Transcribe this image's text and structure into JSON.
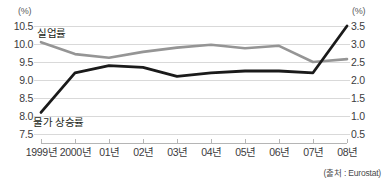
{
  "axes": {
    "left_unit": "(%)",
    "right_unit": "(%)",
    "left_ticks": [
      "10.5",
      "10.0",
      "9.5",
      "9.0",
      "8.5",
      "8.0",
      "7.5"
    ],
    "right_ticks": [
      "3.5",
      "3.0",
      "2.5",
      "2.0",
      "1.5",
      "1.0",
      "0.5"
    ],
    "x_ticks": [
      "1999년",
      "2000년",
      "01년",
      "02년",
      "03년",
      "04년",
      "05년",
      "06년",
      "07년",
      "08년"
    ]
  },
  "labels": {
    "unemployment": "실업률",
    "inflation": "물가 상승률"
  },
  "source": "(출처 : Eurostat)",
  "colors": {
    "unemployment_line": "#959595",
    "inflation_line": "#1a1a1a",
    "gridline": "#d9d9d9",
    "text": "#231f20"
  },
  "chart_data": {
    "type": "line",
    "title": "",
    "xlabel": "",
    "ylabel": "",
    "grid": true,
    "legend": "inline-labels",
    "categories": [
      "1999년",
      "2000년",
      "01년",
      "02년",
      "03년",
      "04년",
      "05년",
      "06년",
      "07년",
      "08년"
    ],
    "axes": {
      "left": {
        "label": "(%)",
        "ylim": [
          7.5,
          10.5
        ],
        "ticks": [
          7.5,
          8.0,
          8.5,
          9.0,
          9.5,
          10.0,
          10.5
        ]
      },
      "right": {
        "label": "(%)",
        "ylim": [
          0.5,
          3.5
        ],
        "ticks": [
          0.5,
          1.0,
          1.5,
          2.0,
          2.5,
          3.0,
          3.5
        ]
      }
    },
    "series": [
      {
        "name": "실업률",
        "axis": "left",
        "color": "#959595",
        "values": [
          10.05,
          9.72,
          9.62,
          9.78,
          9.9,
          9.98,
          9.88,
          9.95,
          9.5,
          9.58
        ]
      },
      {
        "name": "물가 상승률",
        "axis": "right",
        "color": "#1a1a1a",
        "values": [
          1.1,
          2.2,
          2.4,
          2.35,
          2.1,
          2.2,
          2.25,
          2.25,
          2.2,
          3.5
        ]
      }
    ]
  }
}
